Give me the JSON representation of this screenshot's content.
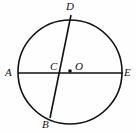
{
  "figure": {
    "kind": "circle-geometry-diagram",
    "background_color": "#fefefe",
    "stroke_color": "#111111",
    "width": 136,
    "height": 132,
    "circle": {
      "name": "main-circle",
      "center_x": 70,
      "center_y": 72,
      "radius": 52,
      "stroke_width": 1.6
    },
    "center_dot": {
      "name": "center-point-dot",
      "x": 70,
      "y": 71,
      "radius": 1.8
    },
    "lines": [
      {
        "name": "diameter-ae",
        "from": "A",
        "to": "E",
        "x1": 18,
        "y1": 73,
        "x2": 123,
        "y2": 73,
        "stroke_width": 1.6
      },
      {
        "name": "chord-db",
        "from": "D",
        "to": "B",
        "x1": 71,
        "y1": 15,
        "x2": 50,
        "y2": 118,
        "stroke_width": 1.6
      }
    ],
    "labels": [
      {
        "id": "A",
        "text": "A",
        "x": 5,
        "y": 67
      },
      {
        "id": "B",
        "text": "B",
        "x": 42,
        "y": 119
      },
      {
        "id": "C",
        "text": "C",
        "x": 50,
        "y": 61
      },
      {
        "id": "D",
        "text": "D",
        "x": 66,
        "y": 1
      },
      {
        "id": "E",
        "text": "E",
        "x": 124,
        "y": 67
      },
      {
        "id": "O",
        "text": "O",
        "x": 75,
        "y": 61
      }
    ]
  }
}
